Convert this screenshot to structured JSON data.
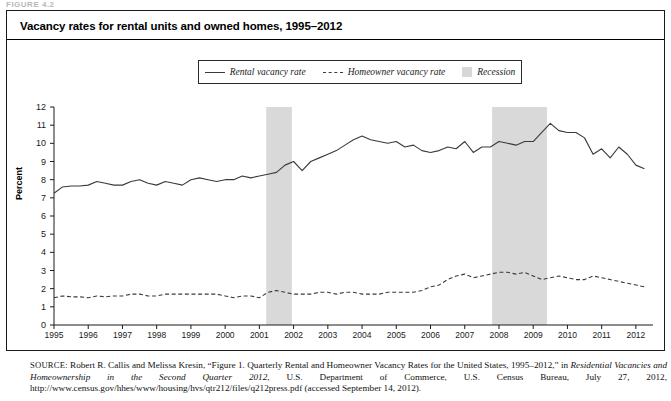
{
  "figure_label": "FIGURE 4.2",
  "title": "Vacancy rates for rental units and owned homes, 1995–2012",
  "legend": {
    "rental": "Rental vacancy rate",
    "homeowner": "Homeowner vacancy rate",
    "recession": "Recession"
  },
  "source": {
    "prefix": "SOURCE",
    "line1": ": Robert R. Callis and Melissa Kresin, “Figure 1. Quarterly Rental and Homeowner Vacancy Rates for the United States, 1995–2012,” in ",
    "italic1": "Residential Vacancies and Homeownership in the Second Quarter 2012",
    "line2": ", U.S. Department of Commerce, U.S. Census Bureau, July 27, 2012, http://www.census.gov/hhes/www/housing/hvs/qtr212/files/q212press.pdf (accessed September 14, 2012)."
  },
  "colors": {
    "rental_line": "#3a3a3a",
    "homeowner_line": "#3a3a3a",
    "recession_band": "#d9d9d9",
    "axis": "#1a1a1a",
    "frame": "#1a1a1a"
  },
  "chart_data": {
    "type": "line",
    "title": "Vacancy rates for rental units and owned homes, 1995–2012",
    "xlabel": "",
    "ylabel": "Percent",
    "ylim": [
      0,
      12
    ],
    "ytick_labels": [
      "0",
      "1",
      "2",
      "3",
      "4",
      "5",
      "6",
      "7",
      "8",
      "9",
      "10",
      "11",
      "12"
    ],
    "xtick_labels": [
      "1995",
      "1996",
      "1997",
      "1998",
      "1999",
      "2000",
      "2001",
      "2002",
      "2003",
      "2004",
      "2005",
      "2006",
      "2007",
      "2008",
      "2009",
      "2010",
      "2011",
      "2012"
    ],
    "xlim": [
      1995.0,
      2012.5
    ],
    "grid": false,
    "legend_position": "top-center",
    "recession_bands": [
      {
        "label": "Recession",
        "start": 2001.2,
        "end": 2001.95
      },
      {
        "label": "Recession",
        "start": 2007.8,
        "end": 2009.4
      }
    ],
    "x": [
      1995.0,
      1995.25,
      1995.5,
      1995.75,
      1996.0,
      1996.25,
      1996.5,
      1996.75,
      1997.0,
      1997.25,
      1997.5,
      1997.75,
      1998.0,
      1998.25,
      1998.5,
      1998.75,
      1999.0,
      1999.25,
      1999.5,
      1999.75,
      2000.0,
      2000.25,
      2000.5,
      2000.75,
      2001.0,
      2001.25,
      2001.5,
      2001.75,
      2002.0,
      2002.25,
      2002.5,
      2002.75,
      2003.0,
      2003.25,
      2003.5,
      2003.75,
      2004.0,
      2004.25,
      2004.5,
      2004.75,
      2005.0,
      2005.25,
      2005.5,
      2005.75,
      2006.0,
      2006.25,
      2006.5,
      2006.75,
      2007.0,
      2007.25,
      2007.5,
      2007.75,
      2008.0,
      2008.25,
      2008.5,
      2008.75,
      2009.0,
      2009.25,
      2009.5,
      2009.75,
      2010.0,
      2010.25,
      2010.5,
      2010.75,
      2011.0,
      2011.25,
      2011.5,
      2011.75,
      2012.0,
      2012.25
    ],
    "series": [
      {
        "name": "Rental vacancy rate",
        "style": "solid",
        "values": [
          7.25,
          7.6,
          7.65,
          7.65,
          7.7,
          7.9,
          7.8,
          7.7,
          7.7,
          7.9,
          8.0,
          7.8,
          7.7,
          7.9,
          7.8,
          7.7,
          8.0,
          8.1,
          8.0,
          7.9,
          8.0,
          8.0,
          8.2,
          8.1,
          8.2,
          8.3,
          8.4,
          8.8,
          9.0,
          8.5,
          9.0,
          9.2,
          9.4,
          9.6,
          9.9,
          10.2,
          10.4,
          10.2,
          10.1,
          10.0,
          10.1,
          9.8,
          9.9,
          9.6,
          9.5,
          9.6,
          9.8,
          9.7,
          10.1,
          9.5,
          9.8,
          9.8,
          10.1,
          10.0,
          9.9,
          10.1,
          10.1,
          10.6,
          11.1,
          10.7,
          10.6,
          10.6,
          10.3,
          9.4,
          9.7,
          9.2,
          9.8,
          9.4,
          8.8,
          8.6
        ]
      },
      {
        "name": "Homeowner vacancy rate",
        "style": "dashed",
        "values": [
          1.5,
          1.6,
          1.55,
          1.55,
          1.5,
          1.6,
          1.55,
          1.6,
          1.6,
          1.7,
          1.7,
          1.6,
          1.6,
          1.7,
          1.7,
          1.7,
          1.7,
          1.7,
          1.7,
          1.7,
          1.6,
          1.5,
          1.6,
          1.6,
          1.5,
          1.8,
          1.9,
          1.8,
          1.7,
          1.7,
          1.7,
          1.8,
          1.8,
          1.7,
          1.8,
          1.8,
          1.7,
          1.7,
          1.7,
          1.8,
          1.8,
          1.8,
          1.8,
          1.9,
          2.1,
          2.2,
          2.5,
          2.7,
          2.8,
          2.6,
          2.7,
          2.8,
          2.9,
          2.9,
          2.8,
          2.9,
          2.7,
          2.5,
          2.6,
          2.7,
          2.6,
          2.5,
          2.5,
          2.7,
          2.6,
          2.5,
          2.4,
          2.3,
          2.2,
          2.1
        ]
      }
    ]
  }
}
